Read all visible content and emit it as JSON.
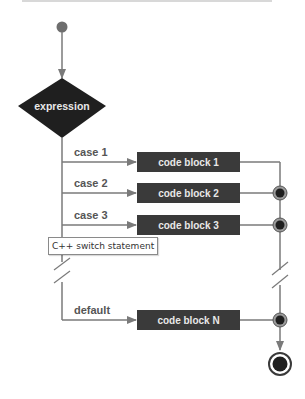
{
  "diagram": {
    "decision": {
      "label": "expression"
    },
    "cases": [
      {
        "label": "case 1",
        "block": "code block 1",
        "has_junction": false
      },
      {
        "label": "case 2",
        "block": "code block 2",
        "has_junction": true
      },
      {
        "label": "case 3",
        "block": "code block 3",
        "has_junction": true
      }
    ],
    "default_case": {
      "label": "default",
      "block": "code block N",
      "has_junction": true
    },
    "tooltip": "C++ switch statement",
    "colors": {
      "line": "#7a7a7a",
      "block_fill": "#3a3a3a",
      "block_text": "#e8e8e8",
      "diamond_fill": "#1f1f1f",
      "start_dot": "#6e6e6e",
      "label_text": "#555555"
    }
  }
}
